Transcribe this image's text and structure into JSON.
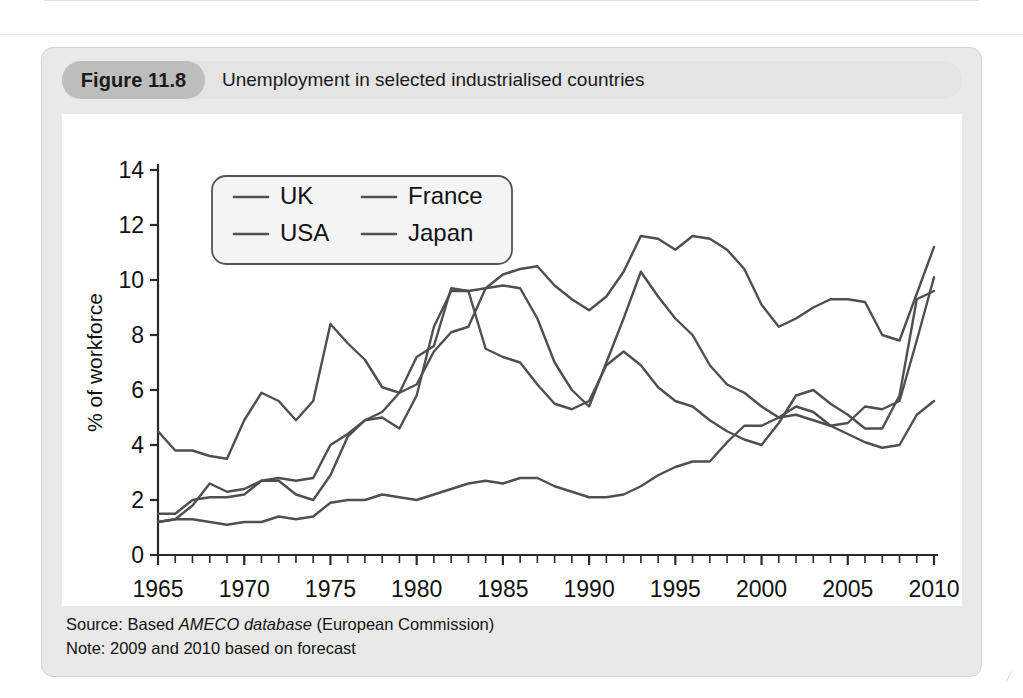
{
  "figure": {
    "number": "Figure 11.8",
    "title": "Unemployment in selected industrialised countries",
    "source_prefix": "Source: Based ",
    "source_italic": "AMECO database",
    "source_suffix": " (European Commission)",
    "note": "Note: 2009 and 2010 based on forecast"
  },
  "colors": {
    "panel_background": "#e9e9e9",
    "caption_bar": "#e4e4e4",
    "figure_number_badge": "#bdbdbd",
    "plot_background": "#ffffff",
    "line": "#4f4f4f",
    "axis": "#2a2a2a",
    "legend_border": "#555555",
    "legend_background": "#f4f4f4"
  },
  "chart_data": {
    "type": "line",
    "title": "Unemployment in selected industrialised countries",
    "xlabel": "",
    "ylabel": "% of workforce",
    "xlim": [
      1965,
      2010
    ],
    "ylim": [
      0,
      14
    ],
    "ytick_step": 2,
    "yticks": [
      0,
      2,
      4,
      6,
      8,
      10,
      12,
      14
    ],
    "xticks": [
      1965,
      1970,
      1975,
      1980,
      1985,
      1990,
      1995,
      2000,
      2005,
      2010
    ],
    "xtick_minor_step": 1,
    "grid": false,
    "legend_position": "top-left",
    "x": [
      1965,
      1966,
      1967,
      1968,
      1969,
      1970,
      1971,
      1972,
      1973,
      1974,
      1975,
      1976,
      1977,
      1978,
      1979,
      1980,
      1981,
      1982,
      1983,
      1984,
      1985,
      1986,
      1987,
      1988,
      1989,
      1990,
      1991,
      1992,
      1993,
      1994,
      1995,
      1996,
      1997,
      1998,
      1999,
      2000,
      2001,
      2002,
      2003,
      2004,
      2005,
      2006,
      2007,
      2008,
      2009,
      2010
    ],
    "series": [
      {
        "name": "UK",
        "values": [
          1.5,
          1.5,
          2.0,
          2.1,
          2.1,
          2.2,
          2.7,
          2.7,
          2.2,
          2.0,
          2.9,
          4.3,
          4.9,
          5.0,
          4.6,
          5.8,
          8.3,
          9.6,
          9.6,
          9.7,
          9.8,
          9.7,
          8.6,
          7.0,
          6.0,
          5.4,
          7.0,
          8.6,
          10.3,
          9.4,
          8.6,
          8.0,
          6.9,
          6.2,
          5.9,
          5.4,
          5.0,
          5.1,
          4.9,
          4.7,
          4.8,
          5.4,
          5.3,
          5.6,
          7.8,
          10.1
        ]
      },
      {
        "name": "USA",
        "values": [
          4.5,
          3.8,
          3.8,
          3.6,
          3.5,
          4.9,
          5.9,
          5.6,
          4.9,
          5.6,
          8.4,
          7.7,
          7.1,
          6.1,
          5.9,
          7.2,
          7.6,
          9.7,
          9.6,
          7.5,
          7.2,
          7.0,
          6.2,
          5.5,
          5.3,
          5.6,
          6.9,
          7.4,
          6.9,
          6.1,
          5.6,
          5.4,
          4.9,
          4.5,
          4.2,
          4.0,
          4.8,
          5.8,
          6.0,
          5.5,
          5.1,
          4.6,
          4.6,
          5.8,
          9.3,
          9.6
        ]
      },
      {
        "name": "France",
        "values": [
          1.2,
          1.3,
          1.8,
          2.6,
          2.3,
          2.4,
          2.7,
          2.8,
          2.7,
          2.8,
          4.0,
          4.4,
          4.9,
          5.2,
          5.9,
          6.2,
          7.4,
          8.1,
          8.3,
          9.7,
          10.2,
          10.4,
          10.5,
          9.8,
          9.3,
          8.9,
          9.4,
          10.3,
          11.6,
          11.5,
          11.1,
          11.6,
          11.5,
          11.1,
          10.4,
          9.1,
          8.3,
          8.6,
          9.0,
          9.3,
          9.3,
          9.2,
          8.0,
          7.8,
          9.5,
          11.2
        ]
      },
      {
        "name": "Japan",
        "values": [
          1.2,
          1.3,
          1.3,
          1.2,
          1.1,
          1.2,
          1.2,
          1.4,
          1.3,
          1.4,
          1.9,
          2.0,
          2.0,
          2.2,
          2.1,
          2.0,
          2.2,
          2.4,
          2.6,
          2.7,
          2.6,
          2.8,
          2.8,
          2.5,
          2.3,
          2.1,
          2.1,
          2.2,
          2.5,
          2.9,
          3.2,
          3.4,
          3.4,
          4.1,
          4.7,
          4.7,
          5.0,
          5.4,
          5.2,
          4.7,
          4.4,
          4.1,
          3.9,
          4.0,
          5.1,
          5.6
        ]
      }
    ]
  },
  "legend": {
    "entries": [
      {
        "label": "UK"
      },
      {
        "label": "France"
      },
      {
        "label": "USA"
      },
      {
        "label": "Japan"
      }
    ]
  }
}
